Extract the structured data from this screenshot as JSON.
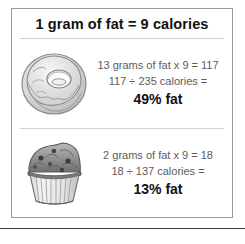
{
  "box": {
    "title": "1 gram of fat = 9 calories",
    "rows": [
      {
        "food_icon": "donut-icon",
        "line1": "13 grams of fat x 9 = 117",
        "line2": "117 ÷ 235 calories =",
        "result": "49% fat"
      },
      {
        "food_icon": "muffin-icon",
        "line1": "2 grams of fat x 9 = 18",
        "line2": "18 ÷ 137 calories =",
        "result": "13% fat"
      }
    ]
  },
  "colors": {
    "box_border": "#9a9a9a",
    "divider": "#d2d2d2",
    "body_text": "#5c5c5c",
    "emphasis_text": "#111111",
    "bottom_rule": "#3a3a3a"
  }
}
